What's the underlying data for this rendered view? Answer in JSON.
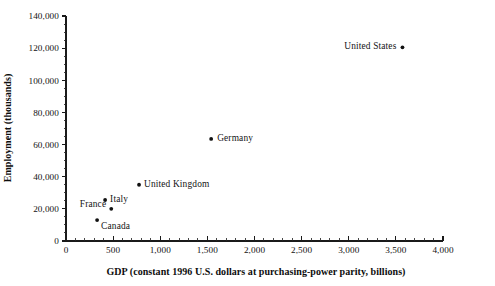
{
  "chart_data": {
    "type": "scatter",
    "title": "",
    "xlabel": "GDP (constant 1996 U.S. dollars at purchasing-power parity, billions)",
    "ylabel": "Employment (thousands)",
    "xlim": [
      0,
      4000
    ],
    "ylim": [
      0,
      140000
    ],
    "grid": false,
    "legend": "none",
    "x_major_step": 500,
    "x_minor_step": 100,
    "y_major_step": 20000,
    "y_minor_step": 5000,
    "xticklabels": [
      "0",
      "500",
      "1,000",
      "1,500",
      "2,000",
      "2,500",
      "3,000",
      "3,500",
      "4,000"
    ],
    "xtickvalues": [
      0,
      500,
      1000,
      1500,
      2000,
      2500,
      3000,
      3500,
      4000
    ],
    "yticklabels": [
      "0",
      "20,000",
      "40,000",
      "60,000",
      "80,000",
      "100,000",
      "120,000",
      "140,000"
    ],
    "ytickvalues": [
      0,
      20000,
      40000,
      60000,
      80000,
      100000,
      120000,
      140000
    ],
    "marker_color": "#111111",
    "axis_color": "#1a1a1a",
    "points": [
      {
        "label": "Canada",
        "x": 330,
        "y": 13000,
        "label_side": "right",
        "label_dx": 4,
        "label_dy": 9
      },
      {
        "label": "France",
        "x": 480,
        "y": 20000,
        "label_side": "left",
        "label_dx": -5,
        "label_dy": -2
      },
      {
        "label": "Italy",
        "x": 415,
        "y": 25500,
        "label_side": "right",
        "label_dx": 5,
        "label_dy": 2
      },
      {
        "label": "United Kingdom",
        "x": 775,
        "y": 35000,
        "label_side": "right",
        "label_dx": 5,
        "label_dy": 2
      },
      {
        "label": "Germany",
        "x": 1540,
        "y": 63500,
        "label_side": "right",
        "label_dx": 6,
        "label_dy": 2
      },
      {
        "label": "United States",
        "x": 3570,
        "y": 120500,
        "label_side": "left",
        "label_dx": -6,
        "label_dy": 2
      }
    ]
  }
}
